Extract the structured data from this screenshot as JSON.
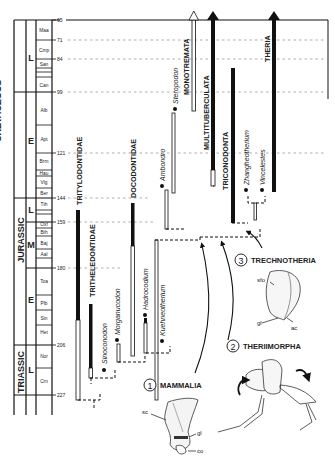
{
  "timescale": {
    "periods": [
      {
        "label": "CRETACEOUS",
        "y0": 20,
        "y1": 144
      },
      {
        "label": "JURASSIC",
        "y0": 144,
        "y1": 206
      },
      {
        "label": "TRIASSIC",
        "y0": 206,
        "y1": 227
      }
    ],
    "epochs": [
      {
        "label": "L",
        "y0": 20,
        "y1": 92
      },
      {
        "label": "E",
        "y0": 92,
        "y1": 198
      },
      {
        "label": "L",
        "y0": 198,
        "y1": 222
      },
      {
        "label": "M",
        "y0": 222,
        "y1": 258
      },
      {
        "label": "E",
        "y0": 258,
        "y1": 338
      },
      {
        "label": "L",
        "y0": 338,
        "y1": 395
      }
    ],
    "stages": [
      "Maa",
      "Cmp",
      "San",
      "Can",
      "Alb",
      "Apt",
      "Brm",
      "Hau",
      "Vlg",
      "Ber",
      "Tth",
      "Oxf",
      "Bth",
      "Baj",
      "Aal",
      "Toa",
      "Plb",
      "Sin",
      "Het",
      "Nor",
      "Crn"
    ],
    "ages_ma": [
      "65",
      "71",
      "84",
      "99",
      "121",
      "144",
      "159",
      "180",
      "206",
      "227"
    ]
  },
  "clades": {
    "tritylodontidae": "TRITYLODONTIDAE",
    "tritheledontidae": "TRITHELEDONTIDAE",
    "docodontidae": "DOCODONTIDAE",
    "monotremata": "MONOTREMATA",
    "multituberculata": "MULTITUBERCULATA",
    "triconodonta": "TRICONODONTA",
    "theria": "THERIA"
  },
  "taxa": {
    "sinoconodon": "Sinoconodon",
    "morganucodon": "Morganucodon",
    "hadrocodium": "Hadrocodium",
    "kuehneotherium": "Kuehneotherium",
    "ambondro": "Ambondro",
    "steropodon": "Steropodon",
    "zhangheotherium": "Zhangheotherium",
    "vincelestes": "Vincelestes"
  },
  "nodes": [
    {
      "number": "1",
      "label": "MAMMALIA"
    },
    {
      "number": "2",
      "label": "THERIIMORPHA"
    },
    {
      "number": "3",
      "label": "TRECHNOTHERIA"
    }
  ],
  "anatomy_labels": {
    "sc": "sc",
    "gl": "gl",
    "co": "co",
    "sfo": "sfo",
    "gl2": "gl",
    "ac": "ac"
  }
}
